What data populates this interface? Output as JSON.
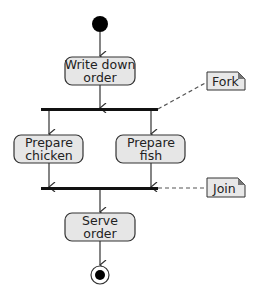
{
  "diagram": {
    "type": "UML activity diagram",
    "start_node": "initial-node",
    "activities": [
      {
        "id": "write",
        "line1": "Write down",
        "line2": "order"
      },
      {
        "id": "chicken",
        "line1": "Prepare",
        "line2": "chicken"
      },
      {
        "id": "fish",
        "line1": "Prepare",
        "line2": "fish"
      },
      {
        "id": "serve",
        "line1": "Serve",
        "line2": "order"
      }
    ],
    "notes": {
      "fork": "Fork",
      "join": "Join"
    },
    "colors": {
      "activity_fill": "#e6e6e6",
      "stroke": "#333333",
      "bar": "#111111",
      "note_fill": "#e8e8e8",
      "note_corner": "#777777"
    }
  }
}
